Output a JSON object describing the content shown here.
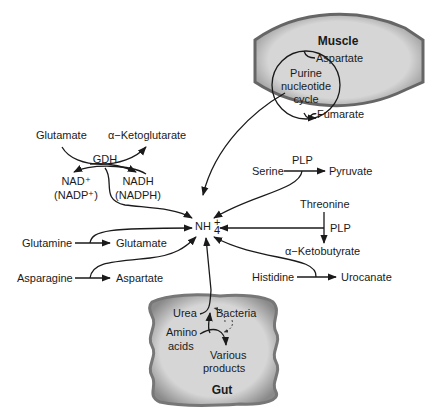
{
  "diagram": {
    "center": {
      "label": "NH",
      "sub": "4",
      "sup": "+"
    },
    "muscle": {
      "title": "Muscle",
      "cycle": [
        "Purine",
        "nucleotide",
        "cycle"
      ],
      "input": "Aspartate",
      "output": "Fumarate"
    },
    "gdh": {
      "enzyme": "GDH",
      "left_top": "Glutamate",
      "right_top": "α−Ketoglutarate",
      "left_bottom": [
        "NAD⁺",
        "(NADP⁺)"
      ],
      "right_bottom": [
        "NADH",
        "(NADPH)"
      ]
    },
    "serine": {
      "substrate": "Serine",
      "cofactor": "PLP",
      "product": "Pyruvate"
    },
    "threonine": {
      "substrate": "Threonine",
      "cofactor": "PLP",
      "product": "α−Ketobutyrate"
    },
    "histidine": {
      "substrate": "Histidine",
      "product": "Urocanate"
    },
    "glutamine": {
      "substrate": "Glutamine",
      "product": "Glutamate"
    },
    "asparagine": {
      "substrate": "Asparagine",
      "product": "Aspartate"
    },
    "gut": {
      "title": "Gut",
      "urea": "Urea",
      "bacteria": "Bacteria",
      "amino": [
        "Amino",
        "acids"
      ],
      "products": [
        "Various",
        "products"
      ]
    }
  }
}
